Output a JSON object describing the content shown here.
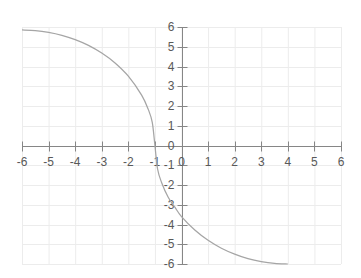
{
  "chart_data": {
    "type": "scatter",
    "title": "",
    "xlabel": "",
    "ylabel": "",
    "xlim": [
      -6,
      6
    ],
    "ylim": [
      -6,
      6
    ],
    "x_ticks": [
      -6,
      -5,
      -4,
      -3,
      -2,
      -1,
      0,
      1,
      2,
      3,
      4,
      5,
      6
    ],
    "y_ticks": [
      -6,
      -5,
      -4,
      -3,
      -2,
      -1,
      0,
      1,
      2,
      3,
      4,
      5,
      6
    ],
    "grid": true,
    "legend": null,
    "series": [
      {
        "name": "Series1",
        "color": "#a5a5a5",
        "line": "smooth",
        "points": [
          [
            -6.0,
            5.85
          ],
          [
            -5.5,
            5.82
          ],
          [
            -5.0,
            5.73
          ],
          [
            -4.5,
            5.58
          ],
          [
            -4.0,
            5.36
          ],
          [
            -3.5,
            5.07
          ],
          [
            -3.0,
            4.68
          ],
          [
            -2.5,
            4.18
          ],
          [
            -2.0,
            3.51
          ],
          [
            -1.5,
            2.55
          ],
          [
            -1.25,
            1.83
          ],
          [
            -1.1,
            1.17
          ],
          [
            -1.0,
            0.0
          ],
          [
            -0.9,
            -1.19
          ],
          [
            -0.75,
            -1.87
          ],
          [
            -0.5,
            -2.62
          ],
          [
            -0.25,
            -3.12
          ],
          [
            0.0,
            -3.6
          ],
          [
            0.5,
            -4.28
          ],
          [
            1.0,
            -4.8
          ],
          [
            1.5,
            -5.2
          ],
          [
            2.0,
            -5.5
          ],
          [
            2.5,
            -5.73
          ],
          [
            3.0,
            -5.88
          ],
          [
            3.5,
            -5.97
          ],
          [
            4.0,
            -6.0
          ]
        ]
      }
    ]
  },
  "axes": {
    "color": "#868686",
    "grid_color": "#ececec",
    "label_color": "#595959"
  }
}
